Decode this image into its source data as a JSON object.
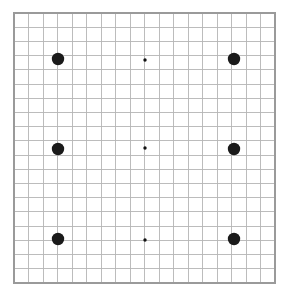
{
  "figure": {
    "background_color": "#ffffff"
  },
  "grid": {
    "name": "graph-paper-grid",
    "origin_x": 14,
    "origin_y": 13,
    "width": 261,
    "height": 270,
    "columns": 18,
    "rows": 19,
    "cell_width": 14.5,
    "cell_height": 14.2,
    "line_color": "#b5b5b5",
    "border_color": "#9a9a9a",
    "show_grid": true
  },
  "markers": {
    "large_color": "#1a1a1a",
    "small_color": "#111111",
    "large_radius": 6.2,
    "small_radius": 1.7,
    "points": [
      {
        "id": "dot-top-left",
        "x": 58,
        "y": 59,
        "size": "large",
        "row": 1,
        "col": 1
      },
      {
        "id": "dot-top-center",
        "x": 145,
        "y": 60,
        "size": "small",
        "row": 1,
        "col": 2
      },
      {
        "id": "dot-top-right",
        "x": 234,
        "y": 59,
        "size": "large",
        "row": 1,
        "col": 3
      },
      {
        "id": "dot-middle-left",
        "x": 58,
        "y": 149,
        "size": "large",
        "row": 2,
        "col": 1
      },
      {
        "id": "dot-middle-center",
        "x": 145,
        "y": 148,
        "size": "small",
        "row": 2,
        "col": 2
      },
      {
        "id": "dot-middle-right",
        "x": 234,
        "y": 149,
        "size": "large",
        "row": 2,
        "col": 3
      },
      {
        "id": "dot-bottom-left",
        "x": 58,
        "y": 239,
        "size": "large",
        "row": 3,
        "col": 1
      },
      {
        "id": "dot-bottom-center",
        "x": 145,
        "y": 240,
        "size": "small",
        "row": 3,
        "col": 2
      },
      {
        "id": "dot-bottom-right",
        "x": 234,
        "y": 239,
        "size": "large",
        "row": 3,
        "col": 3
      }
    ]
  }
}
